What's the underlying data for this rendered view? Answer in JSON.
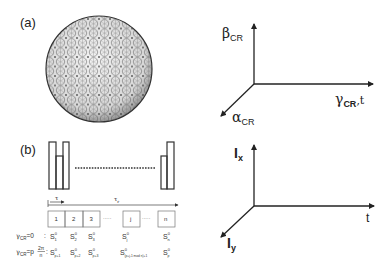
{
  "panel_a": {
    "label": "(a)",
    "sphere": {
      "name": "geodesic sphere",
      "cx": 99,
      "cy": 69,
      "r": 53
    },
    "axes": {
      "vertical": {
        "symbol": "β",
        "sub": "CR"
      },
      "horizontal": {
        "symbol": "γ",
        "sub": "CR",
        "suffix": ",t"
      },
      "diagonal": {
        "symbol": "α",
        "sub": "CR"
      }
    }
  },
  "panel_b": {
    "label": "(b)",
    "timing": {
      "tau": "τ",
      "tau_r": "τ",
      "tau_r_sub": "r"
    },
    "boxes": [
      "1",
      "2",
      "3",
      "j",
      "n"
    ],
    "ellipsis": "·····",
    "rows": [
      {
        "lhs": "γ",
        "lhs_sub": "CR",
        "lhs_eq": "=0",
        "sep": ":",
        "states": [
          {
            "S": "S",
            "sup": "0",
            "sub": "1"
          },
          {
            "S": "S",
            "sup": "0",
            "sub": "2"
          },
          {
            "S": "S",
            "sup": "0",
            "sub": "3"
          },
          {
            "S": "S",
            "sup": "0",
            "sub": "j"
          },
          {
            "S": "S",
            "sup": "0",
            "sub": "n"
          }
        ]
      },
      {
        "lhs": "γ",
        "lhs_sub": "CR",
        "lhs_eq": "=p",
        "frac_num": "2π",
        "frac_den": "n",
        "sep": ":",
        "states": [
          {
            "S": "S",
            "sup": "0",
            "sub": "p+1"
          },
          {
            "S": "S",
            "sup": "0",
            "sub": "p+2"
          },
          {
            "S": "S",
            "sup": "0",
            "sub": "p+3"
          },
          {
            "S": "S",
            "sup": "0",
            "sub": "(p+j-1 mod n)+1"
          },
          {
            "S": "S",
            "sup": "0",
            "sub": "p"
          }
        ]
      }
    ],
    "axes": {
      "vertical": {
        "symbol": "I",
        "sub": "x"
      },
      "horizontal": {
        "symbol": "t"
      },
      "diagonal": {
        "symbol": "I",
        "sub": "y"
      }
    }
  }
}
